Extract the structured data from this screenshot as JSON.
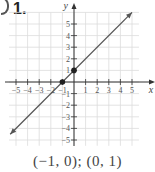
{
  "problem": {
    "number": "1."
  },
  "caption": "(−1, 0); (0, 1)",
  "colors": {
    "grid": "#dcdcdc",
    "axis": "#333333",
    "line": "#555555",
    "point": "#222222"
  },
  "chart_data": {
    "type": "line",
    "title": "",
    "xlabel": "x",
    "ylabel": "y",
    "xlim": [
      -5.5,
      5.5
    ],
    "ylim": [
      -5.5,
      6
    ],
    "grid": true,
    "x_ticks": [
      -5,
      -4,
      -3,
      -2,
      -1,
      1,
      2,
      3,
      4,
      5
    ],
    "y_ticks": [
      -5,
      -4,
      -3,
      -2,
      -1,
      1,
      2,
      3,
      4,
      5
    ],
    "x_tick_labels": [
      "−5",
      "−4",
      "−3",
      "−2",
      "−1",
      "1",
      "2",
      "3",
      "4",
      "5"
    ],
    "y_tick_labels": [
      "−5",
      "−4",
      "−3",
      "−2",
      "−1",
      "1",
      "2",
      "3",
      "4",
      "5"
    ],
    "series": [
      {
        "name": "y = x + 1",
        "x": [
          -5.5,
          5
        ],
        "y": [
          -4.5,
          6
        ]
      }
    ],
    "points": [
      {
        "label": "(-1, 0)",
        "x": -1,
        "y": 0
      },
      {
        "label": "(0, 1)",
        "x": 0,
        "y": 1
      }
    ],
    "annotations": [
      "(−1, 0); (0, 1)"
    ]
  }
}
